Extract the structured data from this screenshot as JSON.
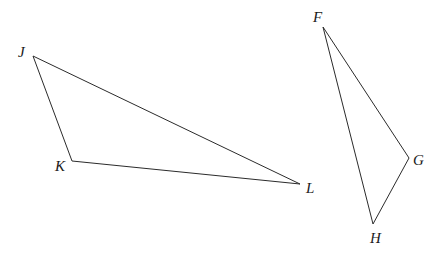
{
  "diagram": {
    "type": "geometry",
    "triangles": [
      {
        "name": "JKL",
        "vertices": [
          {
            "label": "J",
            "x": 33,
            "y": 56,
            "label_x": 18,
            "label_y": 57
          },
          {
            "label": "K",
            "x": 72,
            "y": 161,
            "label_x": 55,
            "label_y": 171
          },
          {
            "label": "L",
            "x": 300,
            "y": 184,
            "label_x": 306,
            "label_y": 193
          }
        ]
      },
      {
        "name": "FGH",
        "vertices": [
          {
            "label": "F",
            "x": 323,
            "y": 27,
            "label_x": 313,
            "label_y": 22
          },
          {
            "label": "G",
            "x": 409,
            "y": 158,
            "label_x": 413,
            "label_y": 165
          },
          {
            "label": "H",
            "x": 373,
            "y": 224,
            "label_x": 370,
            "label_y": 243
          }
        ]
      }
    ],
    "colors": {
      "stroke": "#2b2b2b",
      "label": "#1a1a1a",
      "background": "#ffffff"
    }
  }
}
